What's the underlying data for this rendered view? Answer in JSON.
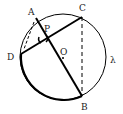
{
  "diagram": {
    "circle_label": "λ",
    "center_label": "O",
    "points": {
      "A": "A",
      "B": "B",
      "C": "C",
      "D": "D",
      "P": "P"
    },
    "segments": [
      {
        "from": "A",
        "to": "B",
        "style": "thick"
      },
      {
        "from": "D",
        "to": "C",
        "style": "thick"
      },
      {
        "from": "C",
        "to": "B",
        "style": "dashed"
      },
      {
        "from": "A",
        "to": "D",
        "style": "dashed"
      }
    ],
    "arcs": [
      {
        "from": "D",
        "to": "B",
        "style": "thick"
      }
    ],
    "colors": {
      "stroke": "#000000",
      "background": "#ffffff"
    }
  }
}
